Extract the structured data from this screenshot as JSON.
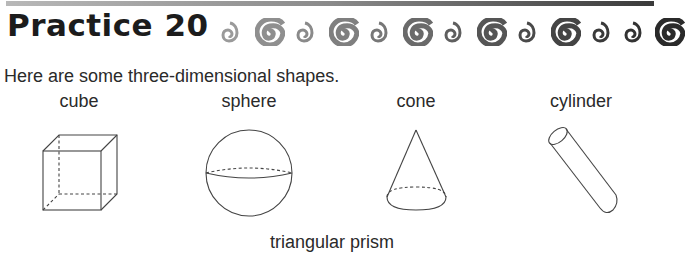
{
  "header": {
    "title": "Practice 20",
    "decorations": [
      {
        "icon": "small-spiral-shell-icon",
        "color": "#9a9a9a"
      },
      {
        "icon": "large-spiral-shell-icon",
        "color": "#8f8f8f"
      },
      {
        "icon": "small-spiral-shell-icon",
        "color": "#8a8a8a"
      },
      {
        "icon": "large-spiral-shell-icon",
        "color": "#7f7f7f"
      },
      {
        "icon": "small-spiral-shell-icon",
        "color": "#777777"
      },
      {
        "icon": "large-spiral-shell-icon",
        "color": "#6a6a6a"
      },
      {
        "icon": "small-spiral-shell-icon",
        "color": "#5f5f5f"
      },
      {
        "icon": "large-spiral-shell-icon",
        "color": "#555555"
      },
      {
        "icon": "small-spiral-shell-icon",
        "color": "#4a4a4a"
      },
      {
        "icon": "large-spiral-shell-icon",
        "color": "#444444"
      },
      {
        "icon": "small-spiral-shell-icon",
        "color": "#3a3a3a"
      },
      {
        "icon": "small-spiral-shell-icon",
        "color": "#333333"
      },
      {
        "icon": "large-spiral-shell-icon",
        "color": "#2a2a2a"
      }
    ]
  },
  "content": {
    "intro": "Here are some three-dimensional shapes.",
    "shapes": [
      {
        "label": "cube"
      },
      {
        "label": "sphere"
      },
      {
        "label": "cone"
      },
      {
        "label": "cylinder"
      },
      {
        "label": "triangular prism"
      }
    ]
  }
}
